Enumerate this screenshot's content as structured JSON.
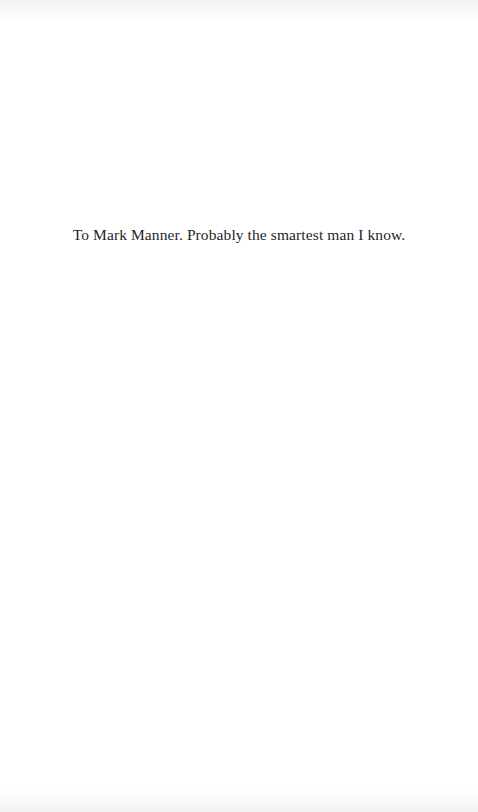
{
  "page": {
    "type": "dedication",
    "dedication_text": "To Mark Manner. Probably the smartest man I know."
  }
}
